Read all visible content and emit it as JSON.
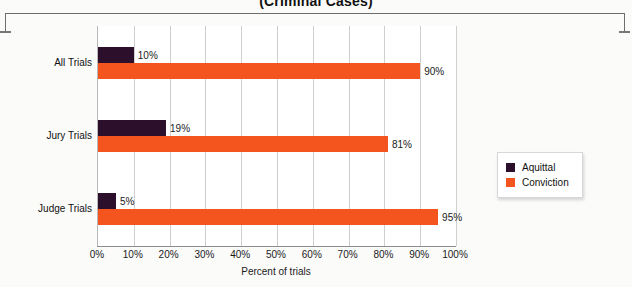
{
  "chart_data": {
    "type": "bar",
    "orientation": "horizontal",
    "title": "(Criminal Cases)",
    "xlabel": "Percent of trials",
    "ylabel": "",
    "xlim": [
      0,
      100
    ],
    "xticks": [
      "0%",
      "10%",
      "20%",
      "30%",
      "40%",
      "50%",
      "60%",
      "70%",
      "80%",
      "90%",
      "100%"
    ],
    "grid": true,
    "legend_position": "right",
    "categories": [
      "All Trials",
      "Jury Trials",
      "Judge Trials"
    ],
    "series": [
      {
        "name": "Aquittal",
        "color": "#2b0f2b",
        "values": [
          10,
          19,
          5
        ],
        "labels": [
          "10%",
          "19%",
          "5%"
        ]
      },
      {
        "name": "Conviction",
        "color": "#f4551f",
        "values": [
          90,
          81,
          95
        ],
        "labels": [
          "90%",
          "81%",
          "95%"
        ]
      }
    ]
  },
  "legend": {
    "items": [
      {
        "label": "Aquittal",
        "color": "#2b0f2b"
      },
      {
        "label": "Conviction",
        "color": "#f4551f"
      }
    ]
  }
}
